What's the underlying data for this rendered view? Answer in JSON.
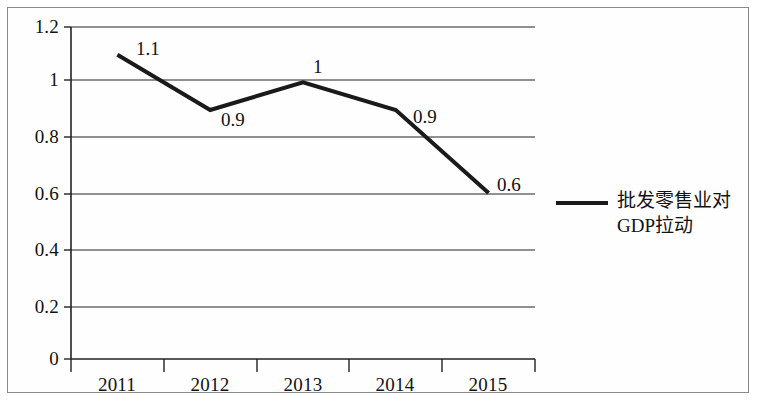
{
  "chart_data": {
    "type": "line",
    "title": "",
    "xlabel": "",
    "ylabel": "",
    "categories": [
      "2011",
      "2012",
      "2013",
      "2014",
      "2015"
    ],
    "series": [
      {
        "name": "批发零售业对GDP拉动",
        "name_lines": [
          "批发零售业对",
          "GDP拉动"
        ],
        "values": [
          1.1,
          0.9,
          1,
          0.9,
          0.6
        ],
        "point_labels": [
          "1.1",
          "0.9",
          "1",
          "0.9",
          "0.6"
        ],
        "color": "#1a1a1a",
        "line_width": 4
      }
    ],
    "ylim": [
      0,
      1.2
    ],
    "y_ticks": [
      0,
      0.2,
      0.4,
      0.6,
      0.8,
      1,
      1.2
    ],
    "y_tick_labels": [
      "0",
      "0.2",
      "0.4",
      "0.6",
      "0.8",
      "1",
      "1.2"
    ],
    "grid": true,
    "grid_axis": "y",
    "legend_position": "right",
    "frame": true
  },
  "legend": {
    "entry_line_1": "批发零售业对",
    "entry_line_2": "GDP拉动"
  },
  "axis": {
    "y_labels": [
      "1.2",
      "1",
      "0.8",
      "0.6",
      "0.4",
      "0.2",
      "0"
    ],
    "x_labels": [
      "2011",
      "2012",
      "2013",
      "2014",
      "2015"
    ]
  },
  "data_labels": {
    "p2011": "1.1",
    "p2012": "0.9",
    "p2013": "1",
    "p2014": "0.9",
    "p2015": "0.6"
  }
}
